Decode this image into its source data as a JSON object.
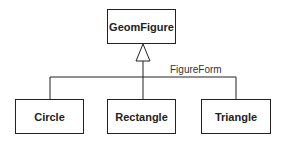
{
  "diagram": {
    "type": "uml-class-generalization",
    "parent": {
      "name": "GeomFigure"
    },
    "discriminator": "FigureForm",
    "children": [
      {
        "name": "Circle"
      },
      {
        "name": "Rectangle"
      },
      {
        "name": "Triangle"
      }
    ],
    "colors": {
      "line": "#222222",
      "background": "#ffffff"
    }
  }
}
